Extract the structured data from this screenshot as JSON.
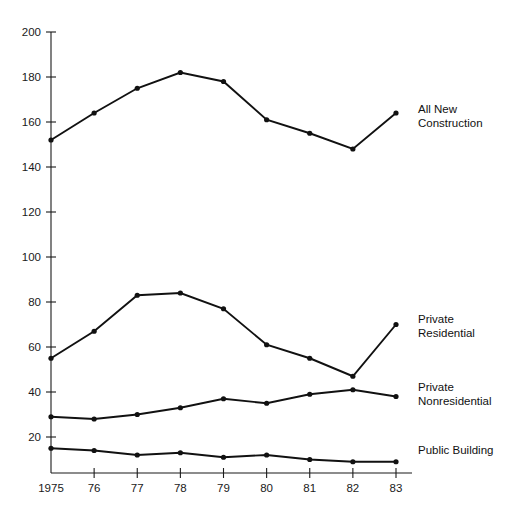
{
  "chart_data": {
    "type": "line",
    "title": "",
    "xlabel": "",
    "ylabel": "",
    "x": [
      1975,
      1976,
      1977,
      1978,
      1979,
      1980,
      1981,
      1982,
      1983
    ],
    "categories": [
      "1975",
      "76",
      "77",
      "78",
      "79",
      "80",
      "81",
      "82",
      "83"
    ],
    "xtick_labels": [
      "1975",
      "76",
      "77",
      "78",
      "79",
      "80",
      "81",
      "82",
      "83"
    ],
    "ytick_labels": [
      "200",
      "180",
      "160",
      "140",
      "120",
      "100",
      "80",
      "60",
      "40",
      "20"
    ],
    "yticks": [
      200,
      180,
      160,
      140,
      120,
      100,
      80,
      60,
      40,
      20
    ],
    "ylim": [
      4,
      200
    ],
    "grid": false,
    "legend_position": "right-inline",
    "series": [
      {
        "name": "All New Construction",
        "label_line1": "All New",
        "label_line2": "Construction",
        "values": [
          152,
          164,
          175,
          182,
          178,
          161,
          155,
          148,
          164
        ]
      },
      {
        "name": "Private Residential",
        "label_line1": "Private",
        "label_line2": "Residential",
        "values": [
          55,
          67,
          83,
          84,
          77,
          61,
          55,
          47,
          70
        ]
      },
      {
        "name": "Private Nonresidential",
        "label_line1": "Private",
        "label_line2": "Nonresidential",
        "values": [
          29,
          28,
          30,
          33,
          37,
          35,
          39,
          41,
          38
        ]
      },
      {
        "name": "Public Building",
        "label_line1": "Public Building",
        "label_line2": "",
        "values": [
          15,
          14,
          12,
          13,
          11,
          12,
          10,
          9,
          9
        ]
      }
    ],
    "colors": {
      "line": "#111111",
      "axis": "#1a1a1a",
      "text": "#1a1a1a",
      "background": "#ffffff"
    }
  },
  "caption": {
    "text": ""
  }
}
